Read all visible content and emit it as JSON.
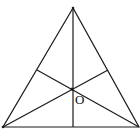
{
  "figure": {
    "type": "triangle-with-cevians",
    "points": {
      "apex": [
        73,
        8
      ],
      "bottom_left": [
        3,
        127
      ],
      "bottom_right": [
        139,
        127
      ],
      "left_side_foot": [
        37,
        70
      ],
      "right_side_foot": [
        108,
        70
      ],
      "base_foot": [
        73,
        127
      ],
      "center": [
        72,
        89
      ]
    },
    "labels": {
      "center": "O"
    },
    "stroke_color": "#1a1a1a"
  }
}
